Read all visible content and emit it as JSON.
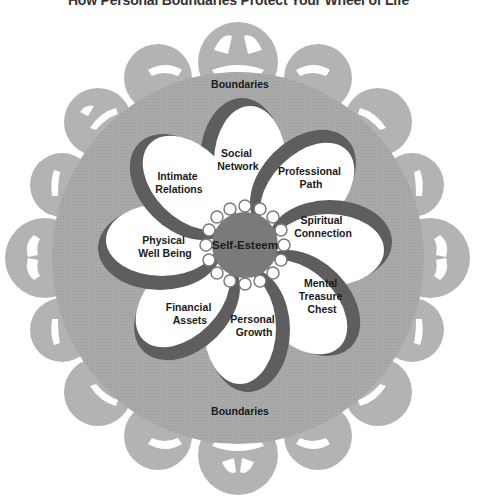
{
  "title": "How Personal Boundaries Protect Your Wheel of Life",
  "boundary": {
    "top_label": "Boundaries",
    "bottom_label": "Boundaries"
  },
  "center": {
    "label": "Self-Esteem"
  },
  "petals": [
    {
      "lines": [
        "Social",
        "Network"
      ]
    },
    {
      "lines": [
        "Professional",
        "Path"
      ]
    },
    {
      "lines": [
        "Spiritual",
        "Connection"
      ]
    },
    {
      "lines": [
        "Mental",
        "Treasure",
        "Chest"
      ]
    },
    {
      "lines": [
        "Personal",
        "Growth"
      ]
    },
    {
      "lines": [
        "Financial",
        "Assets"
      ]
    },
    {
      "lines": [
        "Physical",
        "Well Being"
      ]
    },
    {
      "lines": [
        "Intimate",
        "Relations"
      ]
    }
  ],
  "colors": {
    "disc": "#a8a8a8",
    "lace": "#b4b4b4",
    "petal_fill": "#ffffff",
    "petal_shadow": "#5e5e5e",
    "center": "#7a7a7a",
    "text": "#1a1a1a"
  }
}
